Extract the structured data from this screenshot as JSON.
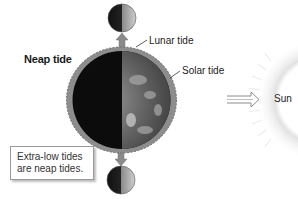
{
  "diagram": {
    "title": "Neap tide",
    "labels": {
      "lunar_tide": "Lunar tide",
      "solar_tide": "Solar tide",
      "sun": "Sun"
    },
    "note": {
      "line1": "Extra-low tides",
      "line2": "are neap tides."
    },
    "icons": {
      "moon_top": "moon-half-lit",
      "moon_bottom": "moon-half-lit",
      "earth": "earth-half-lit",
      "sun": "sun-rays",
      "arrow": "double-line-arrow-right"
    },
    "colors": {
      "tidal_bulge": "#8a8a8a",
      "earth_dark": "#0d0d0d",
      "earth_lit": "#6b6b6b",
      "sun_rays": "#e6e6e6"
    }
  }
}
